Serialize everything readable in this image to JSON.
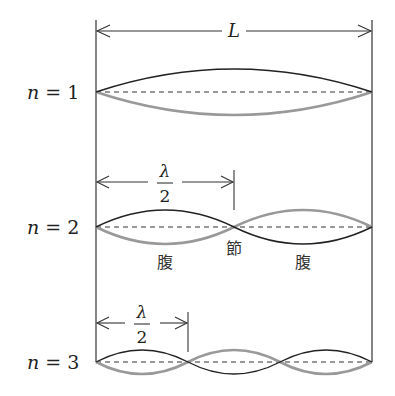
{
  "figure": {
    "length_label": "L",
    "half_wavelength_label": {
      "numerator": "λ",
      "denominator": "2"
    },
    "node_label": "節",
    "antinode_label": "腹",
    "string": {
      "x_start": 96,
      "x_end": 372
    },
    "modes": [
      {
        "n": "1",
        "label_var": "n",
        "label_eq": "=",
        "label_num": "1",
        "baseline_y": 92,
        "amplitude": 23,
        "loops": 1
      },
      {
        "n": "2",
        "label_var": "n",
        "label_eq": "=",
        "label_num": "2",
        "baseline_y": 227,
        "amplitude": 17,
        "loops": 2
      },
      {
        "n": "3",
        "label_var": "n",
        "label_eq": "=",
        "label_num": "3",
        "baseline_y": 362,
        "amplitude": 12,
        "loops": 3
      }
    ],
    "colors": {
      "dark_wave": "#222222",
      "light_wave": "#999999",
      "lines": "#333333"
    }
  }
}
